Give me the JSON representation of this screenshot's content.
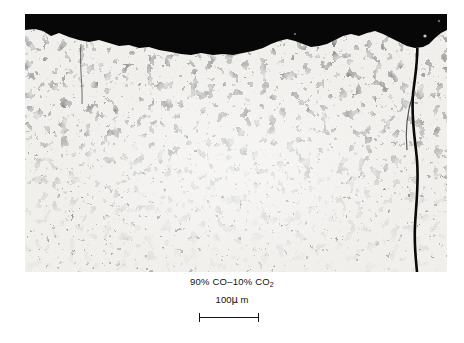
{
  "figure": {
    "type": "metallographic-micrograph",
    "background_color": "#ffffff",
    "matrix_color": "#f2f1ee",
    "phase_color": "#0d0d0d",
    "mount_band_color": "#080808"
  },
  "caption": {
    "gas_prefix": "90% CO",
    "gas_dash": "–",
    "gas_suffix": "10% CO",
    "gas_subscript": "2",
    "gas_full_text": "90% CO–10% CO₂"
  },
  "scale": {
    "label_value": "100",
    "label_mu": "μ",
    "label_unit": " m",
    "label_full": "100μ m",
    "bar_length_px": 60
  }
}
